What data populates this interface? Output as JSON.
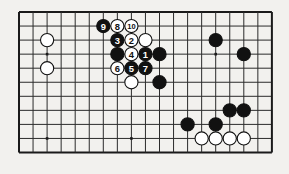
{
  "figure": {
    "board": {
      "cols": 19,
      "rows": 11,
      "origin_x": 19,
      "origin_y": 12,
      "spacing": 14.05,
      "line_color": "#2b2b2b",
      "edge_color": "#1a1a1a",
      "background_color": "#f2f1ee",
      "line_width": 1,
      "edge_width": 2
    },
    "star_points": [
      {
        "col": 2,
        "row": 3
      },
      {
        "col": 2,
        "row": 9
      },
      {
        "col": 14,
        "row": 3
      },
      {
        "col": 8,
        "row": 9
      },
      {
        "col": 14,
        "row": 9
      }
    ],
    "colors": {
      "black_stone": "#111111",
      "white_stone": "#ffffff",
      "stone_outline": "#111111",
      "black_label_text": "#ffffff",
      "white_label_text": "#111111"
    },
    "stone_radius": 6.6,
    "stones": [
      {
        "id": "w-left-upper",
        "col": 2,
        "row": 2,
        "color": "white",
        "label": ""
      },
      {
        "id": "w-left-lower",
        "col": 2,
        "row": 4,
        "color": "white",
        "label": ""
      },
      {
        "id": "b-move-9",
        "col": 6,
        "row": 1,
        "color": "black",
        "label": "9"
      },
      {
        "id": "w-move-8",
        "col": 7,
        "row": 1,
        "color": "white",
        "label": "8"
      },
      {
        "id": "w-move-10",
        "col": 8,
        "row": 1,
        "color": "white",
        "label": "10"
      },
      {
        "id": "b-move-3",
        "col": 7,
        "row": 2,
        "color": "black",
        "label": "3"
      },
      {
        "id": "w-move-2",
        "col": 8,
        "row": 2,
        "color": "white",
        "label": "2"
      },
      {
        "id": "w-plain-upper",
        "col": 9,
        "row": 2,
        "color": "white",
        "label": ""
      },
      {
        "id": "b-plain-left",
        "col": 7,
        "row": 3,
        "color": "black",
        "label": ""
      },
      {
        "id": "w-move-4",
        "col": 8,
        "row": 3,
        "color": "white",
        "label": "4"
      },
      {
        "id": "b-move-1",
        "col": 9,
        "row": 3,
        "color": "black",
        "label": "1"
      },
      {
        "id": "b-plain-right",
        "col": 10,
        "row": 3,
        "color": "black",
        "label": ""
      },
      {
        "id": "w-move-6",
        "col": 7,
        "row": 4,
        "color": "white",
        "label": "6"
      },
      {
        "id": "b-move-5",
        "col": 8,
        "row": 4,
        "color": "black",
        "label": "5"
      },
      {
        "id": "b-move-7",
        "col": 9,
        "row": 4,
        "color": "black",
        "label": "7"
      },
      {
        "id": "w-below-group",
        "col": 8,
        "row": 5,
        "color": "white",
        "label": ""
      },
      {
        "id": "b-below-group",
        "col": 10,
        "row": 5,
        "color": "black",
        "label": ""
      },
      {
        "id": "b-right-upper",
        "col": 14,
        "row": 2,
        "color": "black",
        "label": ""
      },
      {
        "id": "b-right-mid",
        "col": 16,
        "row": 3,
        "color": "black",
        "label": ""
      },
      {
        "id": "b-right-lower-a",
        "col": 15,
        "row": 7,
        "color": "black",
        "label": ""
      },
      {
        "id": "b-right-lower-b",
        "col": 16,
        "row": 7,
        "color": "black",
        "label": ""
      },
      {
        "id": "b-bottom-left",
        "col": 12,
        "row": 8,
        "color": "black",
        "label": ""
      },
      {
        "id": "b-bottom-mid",
        "col": 14,
        "row": 8,
        "color": "black",
        "label": ""
      },
      {
        "id": "w-bottom-1",
        "col": 13,
        "row": 9,
        "color": "white",
        "label": ""
      },
      {
        "id": "w-bottom-2",
        "col": 14,
        "row": 9,
        "color": "white",
        "label": ""
      },
      {
        "id": "w-bottom-3",
        "col": 15,
        "row": 9,
        "color": "white",
        "label": ""
      },
      {
        "id": "w-bottom-4",
        "col": 16,
        "row": 9,
        "color": "white",
        "label": ""
      }
    ]
  }
}
